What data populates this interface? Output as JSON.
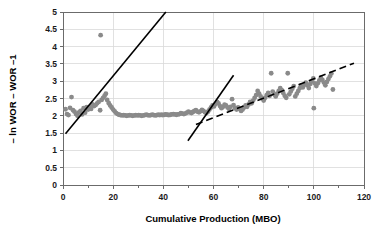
{
  "chart_data": {
    "type": "scatter",
    "title": "",
    "xlabel": "Cumulative Production (MBO)",
    "ylabel": "– ln WOR – WOR –1",
    "xlim": [
      0,
      120
    ],
    "ylim": [
      0,
      5
    ],
    "xticks": [
      0,
      20,
      40,
      60,
      80,
      100,
      120
    ],
    "xtick_labels": [
      "0",
      "20",
      "40",
      "60",
      "80",
      "100",
      "120"
    ],
    "xminor_step": 10,
    "yticks": [
      0,
      0.5,
      1,
      1.5,
      2,
      2.5,
      3,
      3.5,
      4,
      4.5,
      5
    ],
    "ytick_labels": [
      "0",
      "0.5",
      "1",
      "1.5",
      "2",
      "2.5",
      "3",
      "3.5",
      "4",
      "4.5",
      "5"
    ],
    "grid": "horizontal-and-vertical-light",
    "legend": "none",
    "point_color": "#8a8a8a",
    "line_color": "#000000",
    "grid_color": "#d9d9d9",
    "axis_color": "#6b6b6b",
    "series": [
      {
        "name": "WOR data",
        "marker": "circle",
        "points": [
          [
            1.0,
            2.19
          ],
          [
            1.6,
            2.05
          ],
          [
            2.2,
            2.02
          ],
          [
            2.8,
            2.23
          ],
          [
            3.4,
            2.54
          ],
          [
            4.0,
            2.16
          ],
          [
            4.6,
            2.12
          ],
          [
            5.2,
            2.05
          ],
          [
            5.8,
            2.0
          ],
          [
            6.4,
            2.1
          ],
          [
            7.0,
            2.14
          ],
          [
            7.6,
            2.04
          ],
          [
            8.2,
            2.22
          ],
          [
            8.8,
            2.09
          ],
          [
            9.4,
            2.25
          ],
          [
            10.0,
            2.18
          ],
          [
            10.6,
            2.26
          ],
          [
            11.2,
            2.2
          ],
          [
            11.8,
            2.33
          ],
          [
            12.4,
            2.28
          ],
          [
            13.0,
            2.31
          ],
          [
            13.6,
            2.36
          ],
          [
            14.2,
            2.4
          ],
          [
            14.8,
            2.16
          ],
          [
            15.0,
            4.33
          ],
          [
            15.4,
            2.46
          ],
          [
            16.0,
            2.52
          ],
          [
            16.6,
            2.58
          ],
          [
            17.1,
            2.64
          ],
          [
            17.6,
            2.46
          ],
          [
            18.2,
            2.37
          ],
          [
            18.8,
            2.3
          ],
          [
            19.4,
            2.24
          ],
          [
            20.0,
            2.18
          ],
          [
            20.6,
            2.13
          ],
          [
            21.2,
            2.08
          ],
          [
            21.8,
            2.05
          ],
          [
            22.4,
            2.03
          ],
          [
            23.0,
            2.02
          ],
          [
            23.6,
            2.01
          ],
          [
            24.2,
            2.02
          ],
          [
            24.8,
            2.01
          ],
          [
            25.4,
            2.0
          ],
          [
            26.0,
            2.01
          ],
          [
            26.6,
            2.02
          ],
          [
            27.2,
            2.01
          ],
          [
            27.8,
            2.0
          ],
          [
            28.4,
            2.01
          ],
          [
            29.0,
            2.02
          ],
          [
            29.6,
            2.01
          ],
          [
            30.2,
            2.02
          ],
          [
            30.8,
            2.01
          ],
          [
            31.4,
            2.0
          ],
          [
            32.0,
            2.01
          ],
          [
            32.6,
            2.02
          ],
          [
            33.2,
            2.03
          ],
          [
            33.8,
            2.02
          ],
          [
            34.4,
            2.01
          ],
          [
            35.0,
            2.02
          ],
          [
            35.6,
            2.03
          ],
          [
            36.2,
            2.02
          ],
          [
            36.8,
            2.01
          ],
          [
            37.4,
            2.02
          ],
          [
            38.0,
            2.03
          ],
          [
            38.6,
            2.02
          ],
          [
            39.2,
            2.03
          ],
          [
            39.8,
            2.02
          ],
          [
            40.4,
            2.03
          ],
          [
            41.0,
            2.04
          ],
          [
            41.6,
            2.03
          ],
          [
            42.2,
            2.02
          ],
          [
            42.8,
            2.03
          ],
          [
            43.4,
            2.04
          ],
          [
            44.0,
            2.05
          ],
          [
            44.6,
            2.04
          ],
          [
            45.2,
            2.03
          ],
          [
            45.8,
            2.04
          ],
          [
            46.4,
            2.05
          ],
          [
            47.0,
            2.08
          ],
          [
            47.6,
            2.06
          ],
          [
            48.2,
            2.05
          ],
          [
            48.8,
            2.07
          ],
          [
            49.4,
            2.09
          ],
          [
            50.0,
            2.12
          ],
          [
            50.6,
            2.1
          ],
          [
            51.2,
            2.08
          ],
          [
            51.8,
            2.11
          ],
          [
            52.4,
            2.14
          ],
          [
            53.0,
            2.16
          ],
          [
            53.6,
            2.12
          ],
          [
            54.2,
            2.1
          ],
          [
            54.8,
            2.13
          ],
          [
            55.4,
            2.17
          ],
          [
            56.0,
            2.14
          ],
          [
            56.6,
            2.1
          ],
          [
            57.2,
            2.08
          ],
          [
            57.8,
            2.12
          ],
          [
            58.4,
            2.18
          ],
          [
            59.0,
            2.24
          ],
          [
            59.6,
            2.3
          ],
          [
            60.2,
            2.27
          ],
          [
            60.8,
            2.34
          ],
          [
            61.4,
            2.4
          ],
          [
            62.0,
            2.36
          ],
          [
            62.6,
            2.28
          ],
          [
            63.2,
            2.22
          ],
          [
            63.8,
            2.26
          ],
          [
            64.4,
            2.32
          ],
          [
            65.0,
            2.3
          ],
          [
            65.6,
            2.24
          ],
          [
            66.2,
            2.2
          ],
          [
            66.8,
            2.26
          ],
          [
            67.4,
            2.48
          ],
          [
            68.0,
            2.31
          ],
          [
            68.6,
            2.22
          ],
          [
            69.2,
            2.18
          ],
          [
            69.8,
            2.24
          ],
          [
            70.4,
            2.2
          ],
          [
            71.0,
            2.14
          ],
          [
            71.6,
            2.18
          ],
          [
            72.2,
            2.24
          ],
          [
            72.8,
            2.3
          ],
          [
            73.4,
            2.26
          ],
          [
            74.0,
            2.33
          ],
          [
            74.6,
            2.4
          ],
          [
            75.2,
            2.36
          ],
          [
            75.8,
            2.44
          ],
          [
            76.4,
            2.52
          ],
          [
            77.0,
            2.6
          ],
          [
            77.6,
            2.72
          ],
          [
            78.2,
            2.64
          ],
          [
            78.8,
            2.56
          ],
          [
            79.4,
            2.5
          ],
          [
            80.0,
            2.44
          ],
          [
            80.6,
            2.52
          ],
          [
            81.2,
            2.6
          ],
          [
            81.8,
            2.66
          ],
          [
            82.4,
            2.58
          ],
          [
            83.0,
            3.23
          ],
          [
            83.6,
            2.7
          ],
          [
            84.2,
            2.62
          ],
          [
            84.8,
            2.56
          ],
          [
            85.4,
            2.64
          ],
          [
            86.0,
            2.72
          ],
          [
            86.6,
            2.8
          ],
          [
            87.2,
            2.74
          ],
          [
            87.8,
            2.66
          ],
          [
            88.4,
            2.58
          ],
          [
            89.0,
            2.52
          ],
          [
            89.6,
            3.23
          ],
          [
            90.2,
            2.62
          ],
          [
            90.8,
            2.7
          ],
          [
            91.4,
            2.78
          ],
          [
            92.0,
            2.86
          ],
          [
            92.6,
            2.56
          ],
          [
            93.2,
            2.64
          ],
          [
            93.8,
            2.72
          ],
          [
            94.4,
            2.8
          ],
          [
            95.0,
            2.88
          ],
          [
            95.6,
            2.82
          ],
          [
            96.2,
            2.9
          ],
          [
            96.8,
            2.96
          ],
          [
            97.4,
            2.88
          ],
          [
            98.0,
            2.8
          ],
          [
            98.6,
            2.92
          ],
          [
            99.2,
            3.0
          ],
          [
            99.8,
            3.08
          ],
          [
            100.0,
            2.22
          ],
          [
            100.4,
            2.94
          ],
          [
            101.0,
            2.86
          ],
          [
            101.6,
            2.94
          ],
          [
            102.2,
            3.02
          ],
          [
            102.8,
            3.1
          ],
          [
            103.4,
            3.04
          ],
          [
            104.0,
            2.96
          ],
          [
            104.6,
            2.88
          ],
          [
            105.2,
            2.98
          ],
          [
            105.8,
            3.06
          ],
          [
            106.4,
            3.14
          ],
          [
            107.0,
            3.22
          ],
          [
            107.6,
            2.76
          ]
        ]
      }
    ],
    "trend_lines": [
      {
        "name": "early-transient-solid",
        "style": "solid",
        "x0": 1.0,
        "y0": 1.48,
        "x1": 41.0,
        "y1": 5.0
      },
      {
        "name": "late-transient-solid",
        "style": "solid",
        "x0": 49.8,
        "y0": 1.28,
        "x1": 68.0,
        "y1": 3.17
      },
      {
        "name": "boundary-dominated-dashed",
        "style": "dashed",
        "x0": 53.0,
        "y0": 1.75,
        "x1": 116.0,
        "y1": 3.52
      }
    ]
  }
}
